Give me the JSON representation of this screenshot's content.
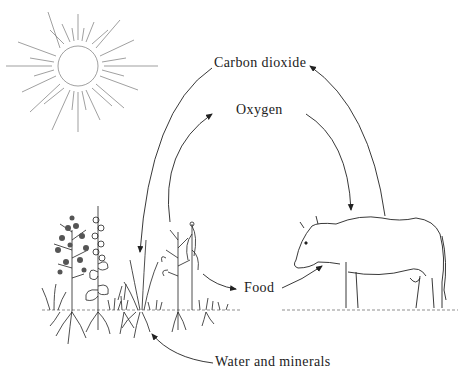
{
  "diagram": {
    "labels": {
      "carbon_dioxide": "Carbon dioxide",
      "oxygen": "Oxygen",
      "food": "Food",
      "water_minerals": "Water and minerals"
    },
    "nodes": [
      {
        "id": "sun",
        "name": "Sun",
        "icon": "sun-icon"
      },
      {
        "id": "plants",
        "name": "Plants",
        "icon": "plants-icon"
      },
      {
        "id": "cow",
        "name": "Cow",
        "icon": "cow-icon"
      }
    ],
    "edges": [
      {
        "from": "cow",
        "to": "plants",
        "label": "Carbon dioxide"
      },
      {
        "from": "plants",
        "to": "cow",
        "label": "Oxygen"
      },
      {
        "from": "plants",
        "to": "cow",
        "label": "Food"
      },
      {
        "from": "soil",
        "to": "plants",
        "label": "Water and minerals"
      }
    ],
    "colors": {
      "ink": "#222222",
      "background": "#ffffff"
    }
  }
}
